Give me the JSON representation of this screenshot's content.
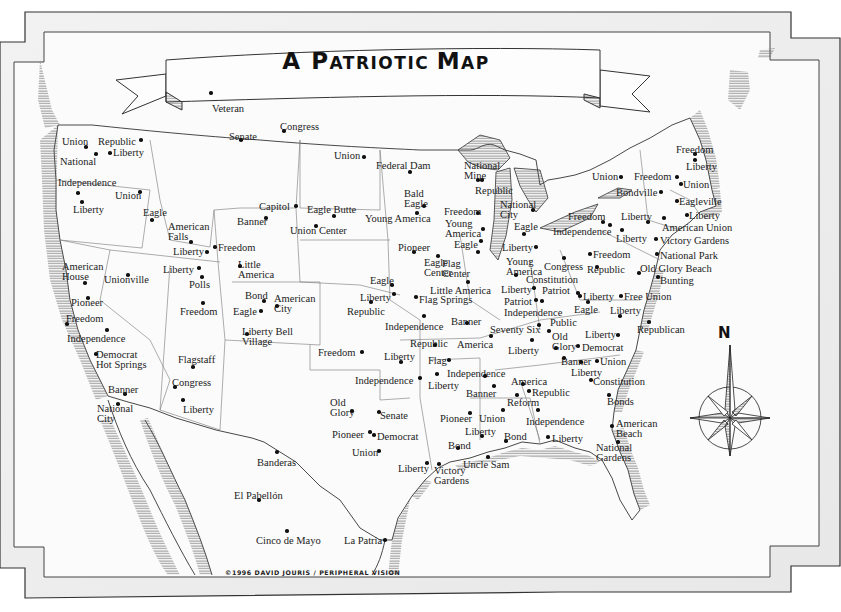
{
  "title": "A Patriotic Map",
  "title_parts": [
    "A ",
    "P",
    "ATRIOTIC ",
    "M",
    "AP"
  ],
  "credit": "©1996 DAVID JOURIS / PERIPHERAL VISION",
  "compass": {
    "label": "N"
  },
  "places": [
    {
      "name": "Veteran",
      "x": 212,
      "y": 104,
      "dx": 211,
      "dy": 93
    },
    {
      "name": "Senate",
      "x": 229,
      "y": 132,
      "dx": 241,
      "dy": 140
    },
    {
      "name": "Congress",
      "x": 280,
      "y": 122,
      "dx": 284,
      "dy": 131
    },
    {
      "name": "Union",
      "x": 62,
      "y": 137,
      "dx": 86,
      "dy": 147
    },
    {
      "name": "Republic",
      "x": 98,
      "y": 137,
      "dx": 141,
      "dy": 140
    },
    {
      "name": "Liberty",
      "x": 113,
      "y": 148,
      "dx": 110,
      "dy": 153
    },
    {
      "name": "National",
      "x": 60,
      "y": 157,
      "dx": 96,
      "dy": 154
    },
    {
      "name": "Independence",
      "x": 58,
      "y": 178,
      "dx": 78,
      "dy": 193
    },
    {
      "name": "Union",
      "x": 115,
      "y": 191,
      "dx": 140,
      "dy": 192
    },
    {
      "name": "Liberty",
      "x": 73,
      "y": 205,
      "dx": 82,
      "dy": 202
    },
    {
      "name": "Eagle",
      "x": 143,
      "y": 208,
      "dx": 152,
      "dy": 220
    },
    {
      "name": "American\nFalls",
      "x": 168,
      "y": 222,
      "dx": 191,
      "dy": 242
    },
    {
      "name": "Liberty",
      "x": 173,
      "y": 247,
      "dx": 207,
      "dy": 252
    },
    {
      "name": "Freedom",
      "x": 218,
      "y": 243,
      "dx": 215,
      "dy": 247
    },
    {
      "name": "Capitol",
      "x": 259,
      "y": 202,
      "dx": 296,
      "dy": 206
    },
    {
      "name": "Banner",
      "x": 237,
      "y": 217,
      "dx": 266,
      "dy": 218
    },
    {
      "name": "Eagle Butte",
      "x": 307,
      "y": 205,
      "dx": 334,
      "dy": 216
    },
    {
      "name": "Union Center",
      "x": 290,
      "y": 226,
      "dx": 316,
      "dy": 226
    },
    {
      "name": "Little\nAmerica",
      "x": 238,
      "y": 260,
      "dx": 240,
      "dy": 266
    },
    {
      "name": "American\nHouse",
      "x": 62,
      "y": 262,
      "dx": 85,
      "dy": 283
    },
    {
      "name": "Unionville",
      "x": 104,
      "y": 275,
      "dx": 128,
      "dy": 275
    },
    {
      "name": "Liberty",
      "x": 163,
      "y": 265,
      "dx": 199,
      "dy": 268
    },
    {
      "name": "Polls",
      "x": 189,
      "y": 280,
      "dx": 202,
      "dy": 277
    },
    {
      "name": "Pioneer",
      "x": 71,
      "y": 298,
      "dx": 88,
      "dy": 298
    },
    {
      "name": "Freedom",
      "x": 66,
      "y": 314,
      "dx": 67,
      "dy": 324
    },
    {
      "name": "Freedom",
      "x": 180,
      "y": 307,
      "dx": 203,
      "dy": 303
    },
    {
      "name": "Bond",
      "x": 245,
      "y": 291,
      "dx": 264,
      "dy": 301
    },
    {
      "name": "American\nCity",
      "x": 274,
      "y": 294,
      "dx": 277,
      "dy": 306
    },
    {
      "name": "Eagle",
      "x": 233,
      "y": 307,
      "dx": 261,
      "dy": 311
    },
    {
      "name": "Liberty Bell\nVillage",
      "x": 242,
      "y": 327,
      "dx": 247,
      "dy": 334
    },
    {
      "name": "Independence",
      "x": 67,
      "y": 334,
      "dx": 107,
      "dy": 330
    },
    {
      "name": "Democrat\nHot Springs",
      "x": 96,
      "y": 350,
      "dx": 96,
      "dy": 354
    },
    {
      "name": "Flagstaff",
      "x": 178,
      "y": 355,
      "dx": 193,
      "dy": 367
    },
    {
      "name": "Congress",
      "x": 172,
      "y": 378,
      "dx": 175,
      "dy": 387
    },
    {
      "name": "Banner",
      "x": 108,
      "y": 385,
      "dx": 125,
      "dy": 394
    },
    {
      "name": "Liberty",
      "x": 183,
      "y": 405,
      "dx": 183,
      "dy": 400
    },
    {
      "name": "National\nCity",
      "x": 97,
      "y": 404,
      "dx": 118,
      "dy": 404
    },
    {
      "name": "Banderas",
      "x": 257,
      "y": 458,
      "dx": 277,
      "dy": 452
    },
    {
      "name": "El Pabellón",
      "x": 234,
      "y": 491,
      "dx": 259,
      "dy": 500
    },
    {
      "name": "Cinco de Mayo",
      "x": 256,
      "y": 536,
      "dx": 287,
      "dy": 531
    },
    {
      "name": "La Patria",
      "x": 344,
      "y": 536,
      "dx": 385,
      "dy": 540
    },
    {
      "name": "Union",
      "x": 334,
      "y": 151,
      "dx": 364,
      "dy": 157
    },
    {
      "name": "Federal Dam",
      "x": 376,
      "y": 161,
      "dx": 410,
      "dy": 172
    },
    {
      "name": "Bald\nEagle",
      "x": 404,
      "y": 189,
      "dx": 424,
      "dy": 206
    },
    {
      "name": "Young America",
      "x": 365,
      "y": 214,
      "dx": 417,
      "dy": 213
    },
    {
      "name": "National\nMine",
      "x": 464,
      "y": 161,
      "dx": 478,
      "dy": 180
    },
    {
      "name": "Republic",
      "x": 475,
      "y": 186,
      "dx": 482,
      "dy": 180
    },
    {
      "name": "Freedom",
      "x": 444,
      "y": 207,
      "dx": 478,
      "dy": 213
    },
    {
      "name": "Young\nAmerica",
      "x": 445,
      "y": 219,
      "dx": 483,
      "dy": 229
    },
    {
      "name": "Eagle",
      "x": 454,
      "y": 240,
      "dx": 481,
      "dy": 241
    },
    {
      "name": "National\nCity",
      "x": 500,
      "y": 200,
      "dx": 533,
      "dy": 210
    },
    {
      "name": "Eagle",
      "x": 514,
      "y": 222,
      "dx": 524,
      "dy": 234
    },
    {
      "name": "Liberty",
      "x": 502,
      "y": 243,
      "dx": 536,
      "dy": 247
    },
    {
      "name": "Pioneer",
      "x": 398,
      "y": 243,
      "dx": 414,
      "dy": 252
    },
    {
      "name": "Eagle\nCenter",
      "x": 424,
      "y": 258,
      "dx": 438,
      "dy": 256
    },
    {
      "name": "Flag\nCenter",
      "x": 442,
      "y": 259,
      "dx": 478,
      "dy": 252
    },
    {
      "name": "Young\nAmerica",
      "x": 506,
      "y": 257,
      "dx": 516,
      "dy": 275
    },
    {
      "name": "Congress",
      "x": 544,
      "y": 262,
      "dx": 564,
      "dy": 258
    },
    {
      "name": "Constitution",
      "x": 526,
      "y": 275,
      "dx": 0,
      "dy": 0
    },
    {
      "name": "Eagle",
      "x": 370,
      "y": 276,
      "dx": 392,
      "dy": 285
    },
    {
      "name": "Little America",
      "x": 430,
      "y": 286,
      "dx": 468,
      "dy": 282
    },
    {
      "name": "Liberty",
      "x": 501,
      "y": 285,
      "dx": 534,
      "dy": 288
    },
    {
      "name": "Patriot",
      "x": 542,
      "y": 286,
      "dx": 578,
      "dy": 293
    },
    {
      "name": "Liberty",
      "x": 360,
      "y": 293,
      "dx": 394,
      "dy": 294
    },
    {
      "name": "Flag Springs",
      "x": 419,
      "y": 295,
      "dx": 416,
      "dy": 297
    },
    {
      "name": "Republic",
      "x": 347,
      "y": 307,
      "dx": 371,
      "dy": 302
    },
    {
      "name": "Patriot",
      "x": 504,
      "y": 297,
      "dx": 536,
      "dy": 300
    },
    {
      "name": "Independence",
      "x": 504,
      "y": 308,
      "dx": 542,
      "dy": 301
    },
    {
      "name": "Independence",
      "x": 385,
      "y": 322,
      "dx": 424,
      "dy": 316
    },
    {
      "name": "Banner",
      "x": 451,
      "y": 317,
      "dx": 467,
      "dy": 323
    },
    {
      "name": "Seventy Six",
      "x": 490,
      "y": 325,
      "dx": 549,
      "dy": 331
    },
    {
      "name": "Public",
      "x": 550,
      "y": 318,
      "dx": 539,
      "dy": 325
    },
    {
      "name": "Republic",
      "x": 410,
      "y": 339,
      "dx": 435,
      "dy": 345
    },
    {
      "name": "America",
      "x": 457,
      "y": 340,
      "dx": 491,
      "dy": 336
    },
    {
      "name": "Old\nGlory",
      "x": 552,
      "y": 332,
      "dx": 556,
      "dy": 348
    },
    {
      "name": "Liberty",
      "x": 508,
      "y": 346,
      "dx": 532,
      "dy": 340
    },
    {
      "name": "Liberty",
      "x": 585,
      "y": 330,
      "dx": 618,
      "dy": 335
    },
    {
      "name": "Republican",
      "x": 637,
      "y": 325,
      "dx": 649,
      "dy": 322
    },
    {
      "name": "Democrat",
      "x": 582,
      "y": 343,
      "dx": 578,
      "dy": 346
    },
    {
      "name": "Freedom",
      "x": 318,
      "y": 348,
      "dx": 362,
      "dy": 352
    },
    {
      "name": "Liberty",
      "x": 384,
      "y": 352,
      "dx": 401,
      "dy": 362
    },
    {
      "name": "Flag",
      "x": 428,
      "y": 356,
      "dx": 449,
      "dy": 360
    },
    {
      "name": "Banner",
      "x": 561,
      "y": 357,
      "dx": 564,
      "dy": 358
    },
    {
      "name": "Union",
      "x": 600,
      "y": 357,
      "dx": 597,
      "dy": 361
    },
    {
      "name": "Liberty",
      "x": 571,
      "y": 368,
      "dx": 581,
      "dy": 362
    },
    {
      "name": "Independence",
      "x": 447,
      "y": 369,
      "dx": 485,
      "dy": 376
    },
    {
      "name": "Independence",
      "x": 355,
      "y": 376,
      "dx": 420,
      "dy": 378
    },
    {
      "name": "Liberty",
      "x": 428,
      "y": 381,
      "dx": 437,
      "dy": 374
    },
    {
      "name": "America",
      "x": 511,
      "y": 377,
      "dx": 523,
      "dy": 384
    },
    {
      "name": "Constitution",
      "x": 593,
      "y": 377,
      "dx": 591,
      "dy": 380
    },
    {
      "name": "Banner",
      "x": 466,
      "y": 389,
      "dx": 494,
      "dy": 386
    },
    {
      "name": "Republic",
      "x": 532,
      "y": 388,
      "dx": 529,
      "dy": 391
    },
    {
      "name": "Reform",
      "x": 507,
      "y": 398,
      "dx": 517,
      "dy": 395
    },
    {
      "name": "Bonds",
      "x": 607,
      "y": 397,
      "dx": 609,
      "dy": 395
    },
    {
      "name": "Old\nGlory",
      "x": 330,
      "y": 398,
      "dx": 352,
      "dy": 411
    },
    {
      "name": "Senate",
      "x": 380,
      "y": 411,
      "dx": 379,
      "dy": 412
    },
    {
      "name": "Pioneer",
      "x": 440,
      "y": 414,
      "dx": 470,
      "dy": 413
    },
    {
      "name": "Union",
      "x": 479,
      "y": 414,
      "dx": 503,
      "dy": 410
    },
    {
      "name": "Independence",
      "x": 526,
      "y": 417,
      "dx": 538,
      "dy": 410
    },
    {
      "name": "American\nBeach",
      "x": 616,
      "y": 419,
      "dx": 612,
      "dy": 426
    },
    {
      "name": "Pioneer",
      "x": 332,
      "y": 430,
      "dx": 370,
      "dy": 432
    },
    {
      "name": "Democrat",
      "x": 377,
      "y": 432,
      "dx": 374,
      "dy": 435
    },
    {
      "name": "Liberty",
      "x": 465,
      "y": 427,
      "dx": 482,
      "dy": 436
    },
    {
      "name": "Bond",
      "x": 448,
      "y": 441,
      "dx": 458,
      "dy": 448
    },
    {
      "name": "Bond",
      "x": 504,
      "y": 432,
      "dx": 506,
      "dy": 441
    },
    {
      "name": "Liberty",
      "x": 552,
      "y": 434,
      "dx": 548,
      "dy": 437
    },
    {
      "name": "Union",
      "x": 352,
      "y": 448,
      "dx": 379,
      "dy": 451
    },
    {
      "name": "National\nGardens",
      "x": 596,
      "y": 443,
      "dx": 618,
      "dy": 442
    },
    {
      "name": "Uncle Sam",
      "x": 463,
      "y": 460,
      "dx": 488,
      "dy": 457
    },
    {
      "name": "Liberty",
      "x": 398,
      "y": 464,
      "dx": 427,
      "dy": 463
    },
    {
      "name": "Victory\nGardens",
      "x": 434,
      "y": 466,
      "dx": 439,
      "dy": 464
    },
    {
      "name": "Freedom",
      "x": 676,
      "y": 145,
      "dx": 695,
      "dy": 154
    },
    {
      "name": "Liberty",
      "x": 686,
      "y": 162,
      "dx": 695,
      "dy": 160
    },
    {
      "name": "Union",
      "x": 592,
      "y": 172,
      "dx": 621,
      "dy": 177
    },
    {
      "name": "Freedom",
      "x": 634,
      "y": 172,
      "dx": 677,
      "dy": 177
    },
    {
      "name": "Union",
      "x": 683,
      "y": 180,
      "dx": 681,
      "dy": 184
    },
    {
      "name": "Bondville",
      "x": 616,
      "y": 188,
      "dx": 661,
      "dy": 192
    },
    {
      "name": "Eagleville",
      "x": 679,
      "y": 197,
      "dx": 677,
      "dy": 201
    },
    {
      "name": "Freedom",
      "x": 568,
      "y": 212,
      "dx": 603,
      "dy": 222
    },
    {
      "name": "Liberty",
      "x": 621,
      "y": 212,
      "dx": 648,
      "dy": 222
    },
    {
      "name": "Liberty",
      "x": 689,
      "y": 211,
      "dx": 687,
      "dy": 215
    },
    {
      "name": "Independence",
      "x": 553,
      "y": 227,
      "dx": 610,
      "dy": 225
    },
    {
      "name": "American Union",
      "x": 662,
      "y": 223,
      "dx": 664,
      "dy": 218
    },
    {
      "name": "Liberty",
      "x": 616,
      "y": 234,
      "dx": 622,
      "dy": 230
    },
    {
      "name": "Victory Gardens",
      "x": 660,
      "y": 236,
      "dx": 656,
      "dy": 239
    },
    {
      "name": "Freedom",
      "x": 593,
      "y": 250,
      "dx": 590,
      "dy": 254
    },
    {
      "name": "National Park",
      "x": 660,
      "y": 251,
      "dx": 657,
      "dy": 254
    },
    {
      "name": "Republic",
      "x": 587,
      "y": 265,
      "dx": 597,
      "dy": 267
    },
    {
      "name": "Old Glory Beach",
      "x": 640,
      "y": 264,
      "dx": 639,
      "dy": 273
    },
    {
      "name": "Bunting",
      "x": 660,
      "y": 276,
      "dx": 658,
      "dy": 277
    },
    {
      "name": "Liberty",
      "x": 583,
      "y": 292,
      "dx": 580,
      "dy": 296
    },
    {
      "name": "Free Union",
      "x": 624,
      "y": 292,
      "dx": 621,
      "dy": 296
    },
    {
      "name": "Eagle",
      "x": 574,
      "y": 305,
      "dx": 588,
      "dy": 302
    },
    {
      "name": "Liberty",
      "x": 610,
      "y": 306,
      "dx": 620,
      "dy": 316
    }
  ]
}
